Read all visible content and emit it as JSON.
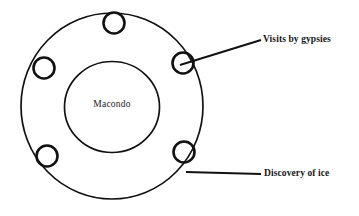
{
  "diagram": {
    "type": "concentric-circle-event-diagram",
    "background_color": "#ffffff",
    "stroke_color": "#111111",
    "core": {
      "label": "Macondo",
      "center_x": 112,
      "center_y": 107,
      "radius": 47
    },
    "outer_ring": {
      "center_x": 112,
      "center_y": 106,
      "radius_x": 91,
      "radius_y": 93
    },
    "event_nodes": [
      {
        "name": "node-top",
        "cx": 114,
        "cy": 23,
        "r": 11
      },
      {
        "name": "node-right",
        "cx": 183,
        "cy": 63,
        "r": 11
      },
      {
        "name": "node-left",
        "cx": 44,
        "cy": 68,
        "r": 11
      },
      {
        "name": "node-bottom-left",
        "cx": 47,
        "cy": 156,
        "r": 11
      },
      {
        "name": "node-bottom-right",
        "cx": 184,
        "cy": 152,
        "r": 11
      }
    ],
    "callouts": [
      {
        "name": "callout-visits-by-gypsies",
        "label": "Visits by gypsies",
        "leader_from_x": 183,
        "leader_from_y": 64,
        "leader_to_x": 261,
        "leader_to_y": 40
      },
      {
        "name": "callout-discovery-of-ice",
        "label": "Discovery of ice",
        "leader_from_x": 186,
        "leader_from_y": 172,
        "leader_to_x": 261,
        "leader_to_y": 174
      }
    ]
  },
  "labels": {
    "core": "Macondo",
    "gypsies": "Visits by gypsies",
    "ice": "Discovery of ice"
  }
}
